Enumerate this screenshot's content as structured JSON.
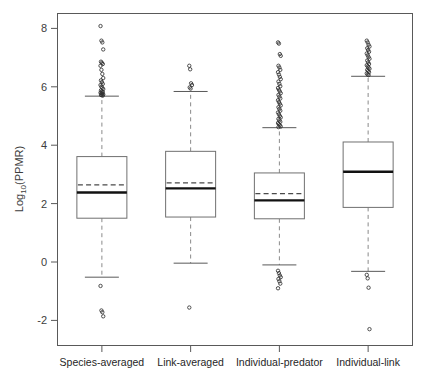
{
  "chart_data": {
    "type": "boxplot",
    "title": "",
    "xlabel": "",
    "ylabel_parts": {
      "main": "Log",
      "sub": "10",
      "tail": "(PPMR)"
    },
    "ylabel": "Log10(PPMR)",
    "ylim": [
      -2.9,
      8.5
    ],
    "yticks": [
      8,
      6,
      4,
      2,
      0,
      -2
    ],
    "ytick_labels": [
      "8",
      "6",
      "4",
      "2",
      "0",
      "-2"
    ],
    "grid": false,
    "legend": "none",
    "categories": [
      "Species-averaged",
      "Link-averaged",
      "Individual-predator",
      "Individual-link"
    ],
    "boxes": [
      {
        "category": "Species-averaged",
        "q1": 1.5,
        "median": 2.38,
        "q3": 3.61,
        "mean": 2.64,
        "whisker_low": -0.52,
        "whisker_high": 5.68,
        "outliers_high": [
          8.08,
          7.58,
          7.52,
          7.28,
          6.86,
          6.82,
          6.78,
          6.72,
          6.58,
          6.44,
          6.3,
          6.22,
          6.16,
          6.1,
          6.06,
          6.0,
          5.96,
          5.92,
          5.88,
          5.84,
          5.82,
          5.8,
          5.78,
          5.76,
          5.74,
          5.72,
          5.71,
          5.7
        ],
        "outliers_low": [
          -0.82,
          -1.66,
          -1.72,
          -1.86
        ]
      },
      {
        "category": "Link-averaged",
        "q1": 1.54,
        "median": 2.52,
        "q3": 3.79,
        "mean": 2.71,
        "whisker_low": -0.04,
        "whisker_high": 5.84,
        "outliers_high": [
          6.72,
          6.6,
          6.12,
          6.06,
          5.98,
          5.94
        ],
        "outliers_low": [
          -1.56
        ]
      },
      {
        "category": "Individual-predator",
        "q1": 1.48,
        "median": 2.11,
        "q3": 3.05,
        "mean": 2.34,
        "whisker_low": -0.1,
        "whisker_high": 4.6,
        "outliers_high": [
          7.52,
          7.48,
          7.12,
          7.06,
          6.72,
          6.66,
          6.58,
          6.5,
          6.42,
          6.34,
          6.26,
          6.18,
          6.1,
          6.02,
          5.96,
          5.9,
          5.84,
          5.78,
          5.72,
          5.66,
          5.6,
          5.54,
          5.48,
          5.42,
          5.36,
          5.3,
          5.24,
          5.18,
          5.12,
          5.06,
          5.0,
          4.95,
          4.9,
          4.85,
          4.8,
          4.76,
          4.72,
          4.68,
          4.64,
          4.62
        ],
        "outliers_low": [
          -0.3,
          -0.38,
          -0.46,
          -0.52,
          -0.58,
          -0.66,
          -0.74,
          -0.9
        ]
      },
      {
        "category": "Individual-link",
        "q1": 1.87,
        "median": 3.09,
        "q3": 4.11,
        "mean": 3.07,
        "whisker_low": -0.32,
        "whisker_high": 6.36,
        "outliers_high": [
          7.58,
          7.52,
          7.44,
          7.38,
          7.32,
          7.26,
          7.2,
          7.14,
          7.08,
          7.02,
          6.96,
          6.9,
          6.84,
          6.78,
          6.74,
          6.7,
          6.66,
          6.62,
          6.58,
          6.54,
          6.5,
          6.46,
          6.42,
          6.4
        ],
        "outliers_low": [
          -0.44,
          -0.56,
          -0.88,
          -2.3
        ]
      }
    ]
  }
}
